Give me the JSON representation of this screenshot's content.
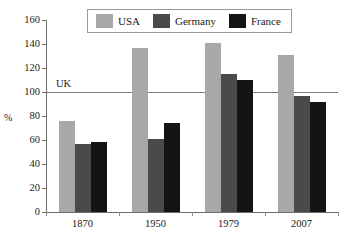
{
  "chart_data": {
    "type": "bar",
    "title": "",
    "subtitle": "",
    "xlabel": "",
    "ylabel": "%",
    "categories": [
      "1870",
      "1950",
      "1979",
      "2007"
    ],
    "series": [
      {
        "name": "USA",
        "values": [
          76,
          137,
          141,
          131
        ],
        "color": "#a8a8a8"
      },
      {
        "name": "Germany",
        "values": [
          57,
          61,
          115,
          97
        ],
        "color": "#4a4a4a"
      },
      {
        "name": "France",
        "values": [
          58,
          74,
          110,
          92
        ],
        "color": "#141414"
      }
    ],
    "ylim": [
      0,
      160
    ],
    "yticks": [
      0,
      20,
      40,
      60,
      80,
      100,
      120,
      140,
      160
    ],
    "grid": false,
    "legend_position": "top-center",
    "reference_line": {
      "label": "UK",
      "value": 100,
      "color": "#7a7a7a"
    }
  },
  "legend": {
    "items": [
      {
        "label": "USA"
      },
      {
        "label": "Germany"
      },
      {
        "label": "France"
      }
    ]
  },
  "axes": {
    "y_label": "%",
    "y_tick_labels": [
      "160",
      "140",
      "120",
      "100",
      "80",
      "60",
      "40",
      "20",
      "0"
    ],
    "x_tick_labels": [
      "1870",
      "1950",
      "1979",
      "2007"
    ]
  }
}
